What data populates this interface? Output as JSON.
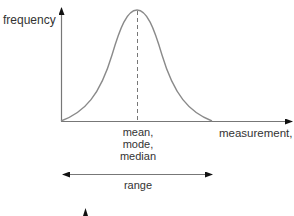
{
  "diagram": {
    "y_axis_label": "frequency",
    "x_axis_label_text": "measurement, ",
    "x_axis_label_var": "x",
    "center_labels": [
      "mean,",
      "mode,",
      "median"
    ],
    "range_label": "range",
    "colors": {
      "curve": "#8a8a8a",
      "axis": "#777777",
      "text": "#333333",
      "arrowhead": "#111111"
    }
  }
}
